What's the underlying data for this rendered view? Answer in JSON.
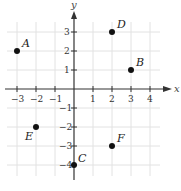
{
  "diagram": {
    "type": "coordinate-plane",
    "x_axis_label": "x",
    "y_axis_label": "y",
    "x_range": [
      -3,
      4
    ],
    "y_range": [
      -4,
      3
    ],
    "x_ticks": [
      {
        "value": -3,
        "label": "−3"
      },
      {
        "value": -2,
        "label": "−2"
      },
      {
        "value": -1,
        "label": "−1"
      },
      {
        "value": 1,
        "label": "1"
      },
      {
        "value": 2,
        "label": "2"
      },
      {
        "value": 3,
        "label": "3"
      },
      {
        "value": 4,
        "label": "4"
      }
    ],
    "y_ticks": [
      {
        "value": 3,
        "label": "3"
      },
      {
        "value": 2,
        "label": "2"
      },
      {
        "value": 1,
        "label": "1"
      },
      {
        "value": -1,
        "label": "−1"
      },
      {
        "value": -2,
        "label": "−2"
      },
      {
        "value": -3,
        "label": "−3"
      },
      {
        "value": -4,
        "label": "−4"
      }
    ],
    "points": [
      {
        "label": "A",
        "x": -3,
        "y": 2
      },
      {
        "label": "B",
        "x": 3,
        "y": 1
      },
      {
        "label": "C",
        "x": 0,
        "y": -4
      },
      {
        "label": "D",
        "x": 2,
        "y": 3
      },
      {
        "label": "E",
        "x": -2,
        "y": -2
      },
      {
        "label": "F",
        "x": 2,
        "y": -3
      }
    ],
    "colors": {
      "grid": "#e2e2e2",
      "axis": "#333333",
      "point": "#111111"
    }
  }
}
